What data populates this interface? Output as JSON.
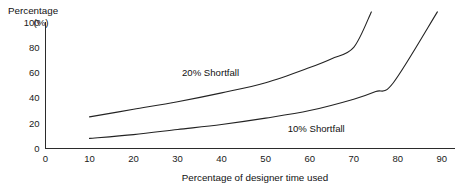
{
  "chart_data": {
    "type": "line",
    "title": "",
    "ylabel": "Percentage",
    "ylabel_unit": "(%)",
    "xlabel": "Percentage of designer time used",
    "xlim": [
      0,
      93
    ],
    "ylim": [
      0,
      112
    ],
    "grid": false,
    "legend_position": "inline-annotations",
    "xticks": [
      0,
      10,
      20,
      30,
      40,
      50,
      60,
      70,
      80,
      90
    ],
    "xtick_labels": [
      "0",
      "10",
      "20",
      "30",
      "40",
      "50",
      "60",
      "70",
      "80",
      "90"
    ],
    "yticks": [
      0,
      20,
      40,
      60,
      80,
      100
    ],
    "ytick_labels": [
      "0",
      "20",
      "40",
      "60",
      "80",
      "100"
    ],
    "series": [
      {
        "name": "20% Shortfall",
        "label": "20% Shortfall",
        "color": "#232323",
        "label_x": 31,
        "label_y": 57,
        "x": [
          10,
          20,
          30,
          40,
          50,
          60,
          65,
          70,
          74
        ],
        "y": [
          25,
          31,
          37,
          44,
          52,
          64,
          71,
          80,
          108
        ]
      },
      {
        "name": "10% Shortfall",
        "label": "10% Shortfall",
        "color": "#232323",
        "label_x": 55,
        "label_y": 13,
        "x": [
          10,
          20,
          30,
          40,
          50,
          60,
          70,
          75,
          79,
          89
        ],
        "y": [
          8,
          11,
          15,
          19,
          24,
          30,
          39,
          45,
          52,
          108
        ]
      }
    ]
  }
}
